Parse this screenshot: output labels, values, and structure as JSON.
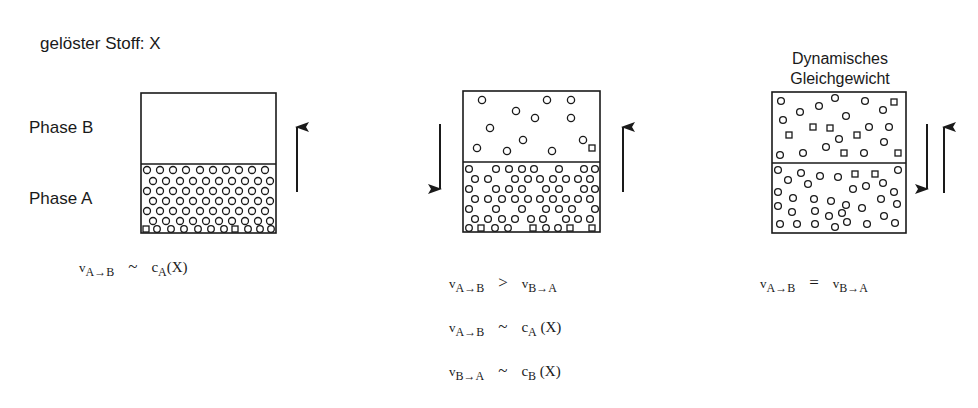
{
  "title": "gelöster Stoff: X",
  "phase_labels": {
    "phase_b": "Phase B",
    "phase_a": "Phase A"
  },
  "panels": [
    {
      "id": "initial",
      "heading": "",
      "upper_phase": "Phase B",
      "lower_phase": "Phase A",
      "upper_particle_density": "empty",
      "lower_particle_density": "high",
      "arrows": [
        "up"
      ],
      "equations": [
        {
          "lhs_v": "v",
          "lhs_sub": "A→B",
          "op": "~",
          "rhs_c": "c",
          "rhs_sub": "A",
          "rhs_arg": "(X)"
        }
      ]
    },
    {
      "id": "intermediate",
      "heading": "",
      "upper_particle_density": "low",
      "lower_particle_density": "medium-high",
      "arrows": [
        "down",
        "up"
      ],
      "equations": [
        {
          "lhs_v": "v",
          "lhs_sub": "A→B",
          "op": ">",
          "rhs_c": "v",
          "rhs_sub": "B→A",
          "rhs_arg": ""
        },
        {
          "lhs_v": "v",
          "lhs_sub": "A→B",
          "op": "~",
          "rhs_c": "c",
          "rhs_sub": "A",
          "rhs_arg": " (X)"
        },
        {
          "lhs_v": "v",
          "lhs_sub": "B→A",
          "op": "~",
          "rhs_c": "c",
          "rhs_sub": "B",
          "rhs_arg": " (X)"
        }
      ]
    },
    {
      "id": "equilibrium",
      "heading_line1": "Dynamisches",
      "heading_line2": "Gleichgewicht",
      "upper_particle_density": "medium",
      "lower_particle_density": "medium",
      "arrows": [
        "down",
        "up"
      ],
      "equations": [
        {
          "lhs_v": "v",
          "lhs_sub": "A→B",
          "op": "=",
          "rhs_c": "v",
          "rhs_sub": "B→A",
          "rhs_arg": ""
        }
      ]
    }
  ],
  "colors": {
    "line": "#1a1a1a",
    "background": "#ffffff"
  }
}
